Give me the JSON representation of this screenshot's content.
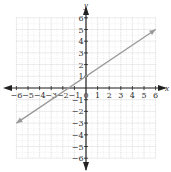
{
  "chart_data": {
    "type": "line",
    "title": "",
    "xlabel": "x",
    "ylabel": "y",
    "xlim": [
      -6,
      6
    ],
    "ylim": [
      -6,
      6
    ],
    "grid": true,
    "x_ticks": [
      -6,
      -5,
      -4,
      -3,
      -2,
      -1,
      0,
      1,
      2,
      3,
      4,
      5,
      6
    ],
    "y_ticks": [
      -6,
      -5,
      -4,
      -3,
      -2,
      -1,
      1,
      2,
      3,
      4,
      5,
      6
    ],
    "series": [
      {
        "name": "y = (2/3)x + 1",
        "x": [
          -6,
          6
        ],
        "y": [
          -3,
          5
        ],
        "color": "#999999",
        "arrows": "both"
      }
    ],
    "axis_arrows": true
  },
  "labels": {
    "x_axis": "x",
    "y_axis": "y",
    "origin": "0"
  },
  "colors": {
    "grid": "#c8c8c8",
    "axis": "#222222",
    "line": "#999999"
  }
}
